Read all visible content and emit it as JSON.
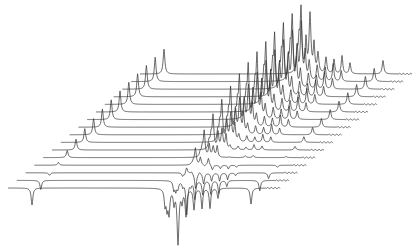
{
  "chart_data": {
    "type": "line",
    "subtype": "stacked-waterfall (arrayed 1D NMR spectra, inversion-recovery style)",
    "title": "",
    "xlabel": "",
    "ylabel": "",
    "grid": false,
    "legend": null,
    "axes_visible": false,
    "trace_count": 16,
    "trace_width_px": 272,
    "first_trace": {
      "x_start": 8,
      "baseline_y": 188
    },
    "trace_offset": {
      "dx": 8.8,
      "dy": -7.6
    },
    "line_color": "#3a3a3a",
    "background": "#ffffff",
    "peaks": [
      {
        "pos": 24,
        "width": 1.0,
        "amp_first": -17,
        "amp_last": 27
      },
      {
        "pos": 157,
        "width": 0.9,
        "amp_first": -16,
        "amp_last": 22
      },
      {
        "pos": 159,
        "width": 0.9,
        "amp_first": -18,
        "amp_last": 30
      },
      {
        "pos": 161,
        "width": 1.0,
        "amp_first": -24,
        "amp_last": 66
      },
      {
        "pos": 166,
        "width": 0.9,
        "amp_first": -14,
        "amp_last": 34
      },
      {
        "pos": 170,
        "width": 1.1,
        "amp_first": -55,
        "amp_last": 64
      },
      {
        "pos": 174,
        "width": 0.9,
        "amp_first": -12,
        "amp_last": 30
      },
      {
        "pos": 178,
        "width": 1.0,
        "amp_first": -27,
        "amp_last": 22
      },
      {
        "pos": 186,
        "width": 1.0,
        "amp_first": -21,
        "amp_last": 18
      },
      {
        "pos": 194,
        "width": 0.9,
        "amp_first": -20,
        "amp_last": 16
      },
      {
        "pos": 202,
        "width": 0.9,
        "amp_first": -20,
        "amp_last": 20
      },
      {
        "pos": 210,
        "width": 0.9,
        "amp_first": -10,
        "amp_last": 12
      },
      {
        "pos": 243,
        "width": 1.0,
        "amp_first": -16,
        "amp_last": 15
      }
    ],
    "recovery_model": "amp(i) = amp_last + (amp_first - amp_last) * exp(-3 * i / (n-1))"
  }
}
